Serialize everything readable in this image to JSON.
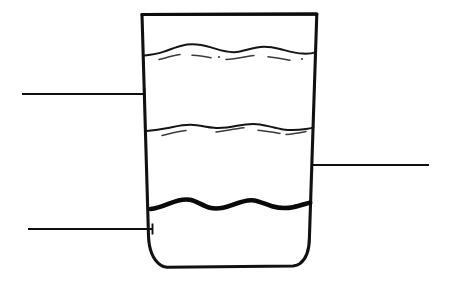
{
  "figure": {
    "background_color": "#ffffff",
    "line_color": "#111111",
    "width": 452,
    "height": 281
  },
  "glass": {
    "name": "tumbler-glass",
    "shape": "tapered-tumbler",
    "rim_left_x": 142,
    "rim_right_x": 317,
    "rim_y": 14,
    "base_left_x": 157,
    "base_right_x": 303,
    "base_y": 266,
    "outline_width": 3.1
  },
  "layers": [
    {
      "id": "layer-top-surface",
      "name": "upper-liquid-surface",
      "y": 52,
      "style": "wavy-thin",
      "amplitude": 5,
      "has_foam_dashes": true,
      "stroke_width": 2.0
    },
    {
      "id": "layer-middle-surface",
      "name": "middle-liquid-surface",
      "y": 128,
      "style": "wavy-thin",
      "amplitude": 5,
      "has_foam_dashes": true,
      "stroke_width": 2.0
    },
    {
      "id": "layer-bottom-surface",
      "name": "lower-liquid-surface",
      "y": 205,
      "style": "wavy-bold",
      "amplitude": 7,
      "has_foam_dashes": false,
      "stroke_width": 4.6
    }
  ],
  "callouts": [
    {
      "id": "callout-upper-left",
      "name": "callout-upper-left",
      "side": "left",
      "label": "",
      "line_start_x": 22,
      "line_end_x": 144,
      "line_y": 94,
      "tick_height": 11,
      "tick_x": 144
    },
    {
      "id": "callout-right",
      "name": "callout-right",
      "side": "right",
      "label": "",
      "line_start_x": 311,
      "line_end_x": 429,
      "line_y": 165,
      "tick_height": 11,
      "tick_x": 312
    },
    {
      "id": "callout-lower-left",
      "name": "callout-lower-left",
      "side": "left",
      "label": "",
      "line_start_x": 28,
      "line_end_x": 153,
      "line_y": 229,
      "tick_height": 11,
      "tick_x": 152
    }
  ]
}
